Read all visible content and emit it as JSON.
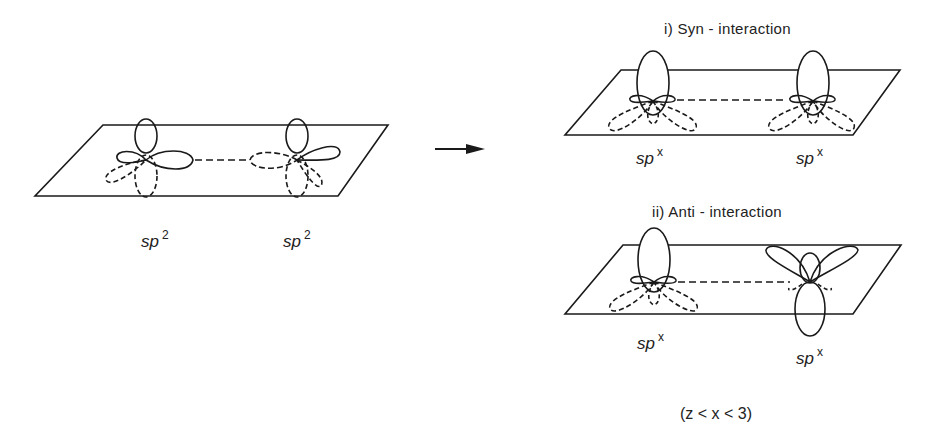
{
  "left_panel": {
    "orbital_labels": [
      {
        "base": "sp",
        "exp": "2"
      },
      {
        "base": "sp",
        "exp": "2"
      }
    ]
  },
  "arrow": {
    "icon": "right-arrow-icon"
  },
  "syn_panel": {
    "title": "i)  Syn - interaction",
    "orbital_labels": [
      {
        "base": "sp",
        "exp": "x"
      },
      {
        "base": "sp",
        "exp": "x"
      }
    ]
  },
  "anti_panel": {
    "title": "ii)  Anti - interaction",
    "orbital_labels": [
      {
        "base": "sp",
        "exp": "x"
      },
      {
        "base": "sp",
        "exp": "x"
      }
    ]
  },
  "condition": "(z < x < 3)",
  "colors": {
    "ink": "#1a1a1a",
    "background": "#ffffff"
  }
}
